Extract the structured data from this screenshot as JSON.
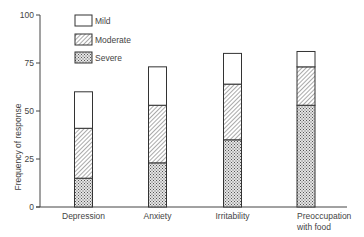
{
  "chart_data": {
    "type": "bar",
    "stacked": true,
    "title": "",
    "xlabel": "",
    "ylabel": "Frequency of response",
    "ylim": [
      0,
      100
    ],
    "yticks": [
      0,
      25,
      50,
      75,
      100
    ],
    "categories": [
      "Depression",
      "Anxiety",
      "Irritability",
      "Preoccupation with food"
    ],
    "category_lines": [
      [
        "Depression"
      ],
      [
        "Anxiety"
      ],
      [
        "Irritability"
      ],
      [
        "Preoccupation",
        "with food"
      ]
    ],
    "series": [
      {
        "name": "Severe",
        "pattern": "dots",
        "values": [
          15,
          23,
          35,
          53
        ]
      },
      {
        "name": "Moderate",
        "pattern": "diagonal-hatch",
        "values": [
          26,
          30,
          29,
          20
        ]
      },
      {
        "name": "Mild",
        "pattern": "none",
        "values": [
          19,
          20,
          16,
          8
        ]
      }
    ],
    "totals": [
      60,
      73,
      80,
      81
    ],
    "legend": {
      "position": "upper-left",
      "entries": [
        "Mild",
        "Moderate",
        "Severe"
      ]
    },
    "grid": false
  }
}
